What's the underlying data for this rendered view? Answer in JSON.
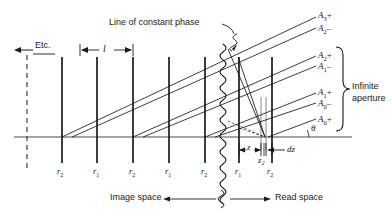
{
  "figure": {
    "type": "optical-wave-diagram",
    "annotations": {
      "etc": "Etc.",
      "line_of_constant_phase": "Line of constant phase",
      "spacing_l": "l",
      "infinite_aperture_line1": "Infinite",
      "infinite_aperture_line2": "aperture",
      "image_space": "Image space",
      "read_space": "Read space",
      "theta": "θ",
      "z": "z",
      "z2": "z₂",
      "dz": "dz"
    },
    "amplitude_labels": [
      {
        "id": "A3p",
        "base": "A",
        "sub": "3",
        "sign": "+"
      },
      {
        "id": "A2m",
        "base": "A",
        "sub": "2",
        "sign": "–"
      },
      {
        "id": "A2p",
        "base": "A",
        "sub": "2",
        "sign": "+"
      },
      {
        "id": "A1m",
        "base": "A",
        "sub": "1",
        "sign": "–"
      },
      {
        "id": "A1p",
        "base": "A",
        "sub": "1",
        "sign": "+"
      },
      {
        "id": "A0m",
        "base": "A",
        "sub": "0",
        "sign": "–"
      },
      {
        "id": "A0p",
        "base": "A",
        "sub": "0",
        "sign": "+"
      }
    ],
    "index_labels": [
      {
        "base": "r",
        "sub": "2"
      },
      {
        "base": "r",
        "sub": "1"
      },
      {
        "base": "r",
        "sub": "2"
      },
      {
        "base": "r",
        "sub": "1"
      },
      {
        "base": "r",
        "sub": "2"
      },
      {
        "base": "r",
        "sub": "1"
      },
      {
        "base": "r",
        "sub": "2"
      }
    ],
    "colors": {
      "ink": "#1a1a1a",
      "background": "#ffffff",
      "thin_rule": "#555555"
    }
  }
}
